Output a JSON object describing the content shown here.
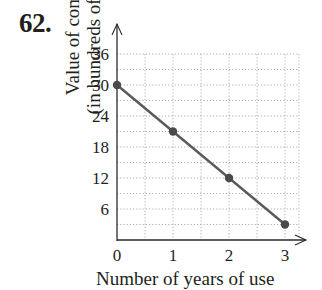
{
  "problem_number": "62.",
  "chart_data": {
    "type": "line",
    "title": "",
    "xlabel": "Number of years of use",
    "ylabel": "Value of computer (in hundreds of dollars)",
    "ylabel_lines": [
      "Value of computer",
      "(in hundreds of dollars)"
    ],
    "x": [
      0,
      1,
      2,
      3
    ],
    "values": [
      30,
      21,
      12,
      3
    ],
    "series": [
      {
        "name": "Value",
        "x": [
          0,
          1,
          2,
          3
        ],
        "values": [
          30,
          21,
          12,
          3
        ],
        "markers": true,
        "color": "#5a5a5a"
      }
    ],
    "x_ticks": [
      "0",
      "1",
      "2",
      "3"
    ],
    "y_ticks": [
      "6",
      "12",
      "18",
      "24",
      "30",
      "36"
    ],
    "xlim": [
      0,
      3.2
    ],
    "ylim": [
      0,
      36
    ],
    "grid": true,
    "grid_style": "dotted",
    "legend": null
  },
  "visible_text": {
    "xlabel_partial": "Number of years of use"
  }
}
